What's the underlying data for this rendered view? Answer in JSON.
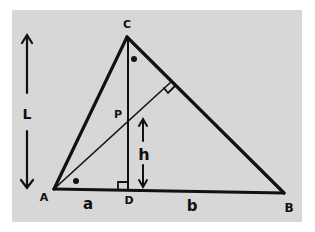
{
  "diagram": {
    "colors": {
      "panel": "#d7d7d7",
      "background": "#ffffff",
      "stroke": "#111111"
    },
    "vertices": {
      "A": "A",
      "B": "B",
      "C": "C",
      "D": "D",
      "P": "P"
    },
    "segment_labels": {
      "a": "a",
      "b": "b",
      "h": "h",
      "L": "L"
    },
    "markers": {
      "right_angle_at_D": true,
      "right_angle_on_CB": true,
      "equal_angle_dots": [
        "angle at C (DCB)",
        "angle at A (PAD)"
      ]
    }
  }
}
